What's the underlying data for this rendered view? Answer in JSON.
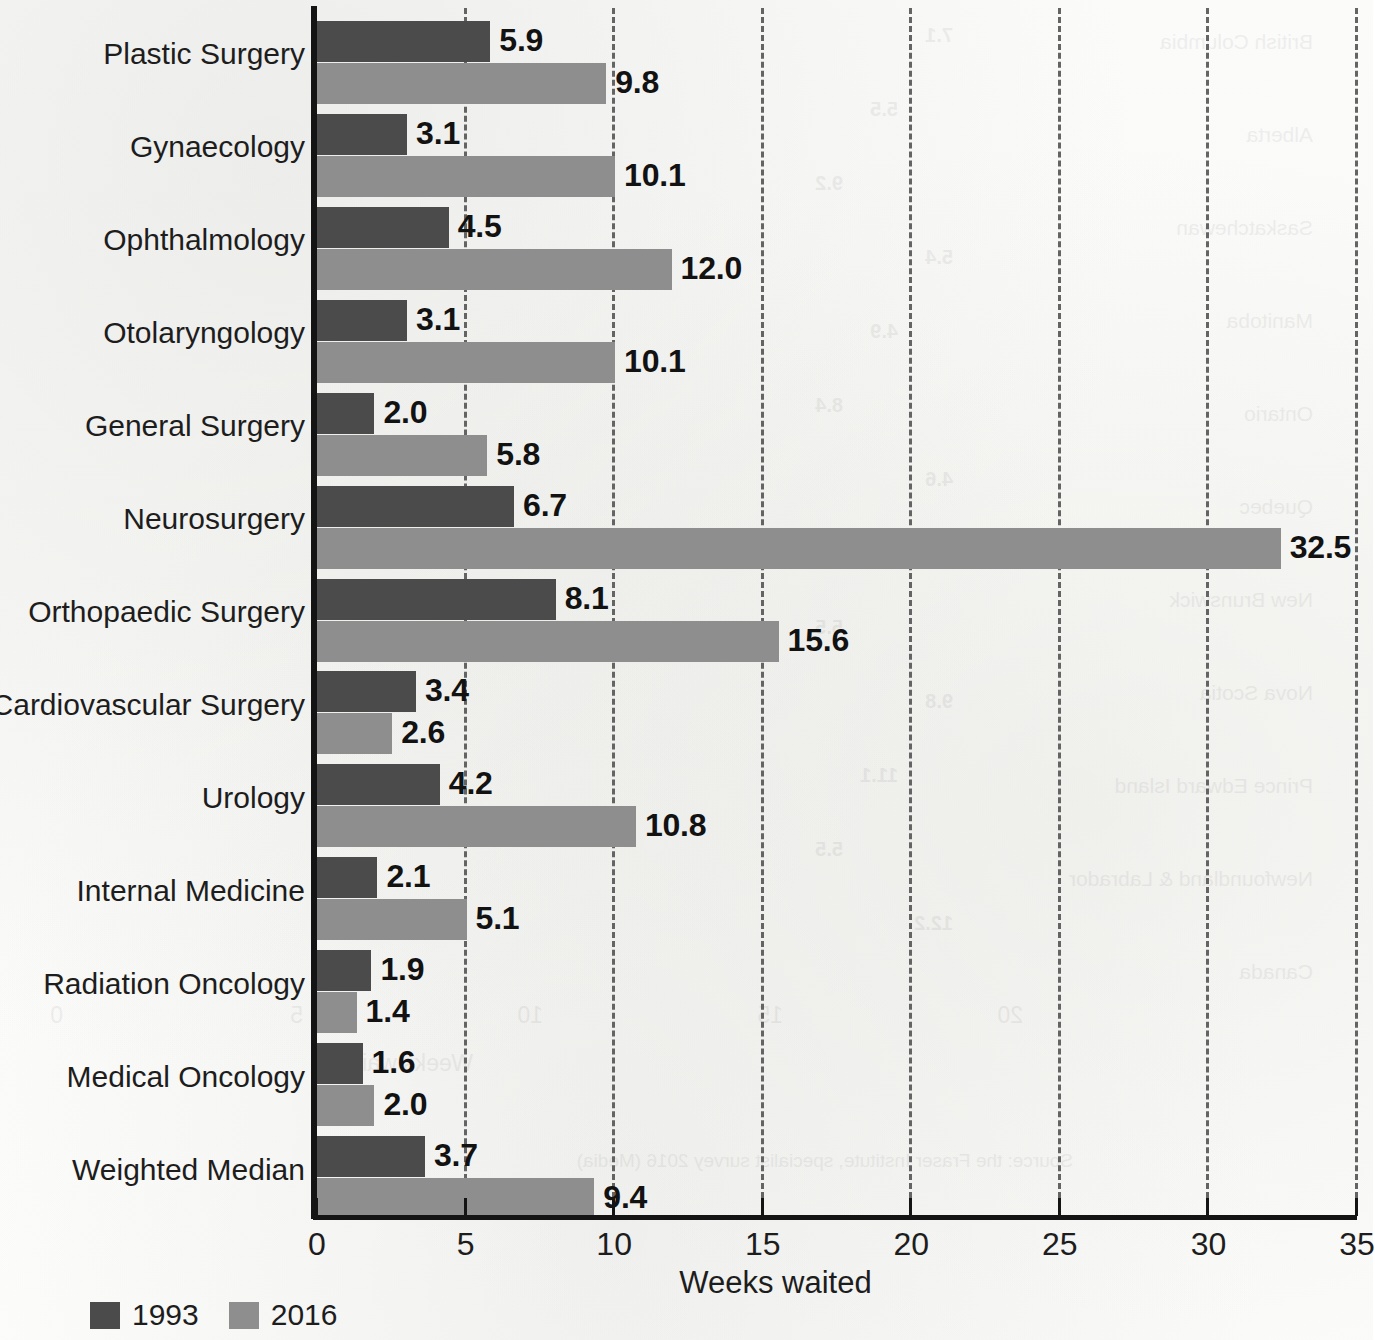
{
  "chart_data": {
    "type": "bar",
    "orientation": "horizontal",
    "title": "",
    "subtitle": "",
    "xlabel": "Weeks waited",
    "ylabel": "",
    "xlim": [
      0,
      35
    ],
    "xticks": [
      "0",
      "5",
      "10",
      "15",
      "20",
      "25",
      "30",
      "35"
    ],
    "xtick_values": [
      0,
      5,
      10,
      15,
      20,
      25,
      30,
      35
    ],
    "grid": "vertical-dashed",
    "legend_position": "bottom-left",
    "categories": [
      "Plastic Surgery",
      "Gynaecology",
      "Ophthalmology",
      "Otolaryngology",
      "General Surgery",
      "Neurosurgery",
      "Orthopaedic Surgery",
      "Cardiovascular Surgery",
      "Urology",
      "Internal Medicine",
      "Radiation Oncology",
      "Medical Oncology",
      "Weighted Median"
    ],
    "series": [
      {
        "name": "1993",
        "color": "#4b4b4b",
        "values": [
          5.9,
          3.1,
          4.5,
          3.1,
          2.0,
          6.7,
          8.1,
          3.4,
          4.2,
          2.1,
          1.9,
          1.6,
          3.7
        ],
        "labels": [
          "5.9",
          "3.1",
          "4.5",
          "3.1",
          "2.0",
          "6.7",
          "8.1",
          "3.4",
          "4.2",
          "2.1",
          "1.9",
          "1.6",
          "3.7"
        ]
      },
      {
        "name": "2016",
        "color": "#8e8e8e",
        "values": [
          9.8,
          10.1,
          12.0,
          10.1,
          5.8,
          32.5,
          15.6,
          2.6,
          10.8,
          5.1,
          1.4,
          2.0,
          9.4
        ],
        "labels": [
          "9.8",
          "10.1",
          "12.0",
          "10.1",
          "5.8",
          "32.5",
          "15.6",
          "2.6",
          "10.8",
          "5.1",
          "1.4",
          "2.0",
          "9.4"
        ]
      }
    ]
  },
  "legend": {
    "items": [
      {
        "label": "1993",
        "color": "#4b4b4b"
      },
      {
        "label": "2016",
        "color": "#8e8e8e"
      }
    ]
  },
  "axis": {
    "x_title": "Weeks waited"
  },
  "bleed_through": {
    "rows": [
      "British Columbia",
      "Alberta",
      "Saskatchewan",
      "Manitoba",
      "Ontario",
      "Quebec",
      "New Brunswick",
      "Nova Scotia",
      "Prince Edward Island",
      "Newfoundland & Labrador",
      "Canada"
    ],
    "values": [
      "7.1",
      "5.5",
      "9.2",
      "5.4",
      "4.9",
      "8.4",
      "4.6",
      "6.9",
      "5.5",
      "9.8",
      "11.1",
      "5.5",
      "12.2"
    ],
    "ticks": [
      "0",
      "5",
      "10",
      "15",
      "20"
    ],
    "axis_title": "Weeks waited",
    "source_note": "Source: the Fraser Institute, specialist survey 2016 (Media)"
  }
}
